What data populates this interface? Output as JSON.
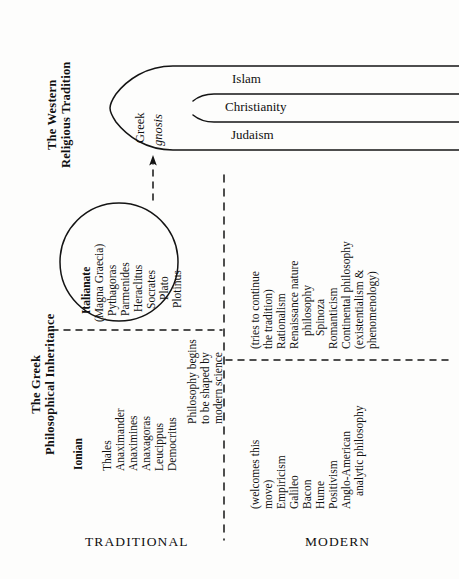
{
  "diagram": {
    "title_religious": {
      "line1": "The Western",
      "line2": "Religious Tradition"
    },
    "title_philosophical": {
      "line1": "The Greek",
      "line2": "Philosophical Inheritance"
    },
    "bottom_axis": {
      "left": "TRADITIONAL",
      "right": "MODERN"
    }
  },
  "religious_stream": {
    "source_roman": "Greek",
    "source_italic": "gnosis",
    "bands": [
      {
        "label": "Islam"
      },
      {
        "label": "Christianity"
      },
      {
        "label": "Judaism"
      }
    ]
  },
  "greek_inheritance": {
    "italianate": {
      "heading": "Italianate",
      "subheading": "(Magna Graecia)",
      "figures": [
        "Pythagoras",
        "Parmenides",
        "Heraclitus",
        "Socrates",
        "Plato",
        "Plotinus"
      ]
    },
    "ionian": {
      "heading": "Ionian",
      "figures": [
        "Thales",
        "Anaximander",
        "Anaximines",
        "Anaxagoras",
        "Leucippus",
        "Democritus"
      ]
    }
  },
  "transition_note": {
    "line1": "Philosophy begins",
    "line2": "to be shaped by",
    "line3": "modern science"
  },
  "modern_branches": {
    "continuing": {
      "parenthetical_line1": "(tries to continue",
      "parenthetical_line2": "the tradition)",
      "items": [
        "Rationalism",
        "Renaissance nature",
        "philosophy",
        "Spinoza",
        "Romanticism",
        "Continental philosophy",
        "(existentialism &",
        "phenomenology)"
      ]
    },
    "welcoming": {
      "parenthetical_line1": "(welcomes this",
      "parenthetical_line2": "move)",
      "items": [
        "Empiricism",
        "Galileo",
        "Bacon",
        "Hume",
        "Positivism",
        "Anglo-American",
        "analytic philosophy"
      ]
    }
  },
  "colors": {
    "ink": "#101010",
    "paper": "#fdfdfc"
  }
}
